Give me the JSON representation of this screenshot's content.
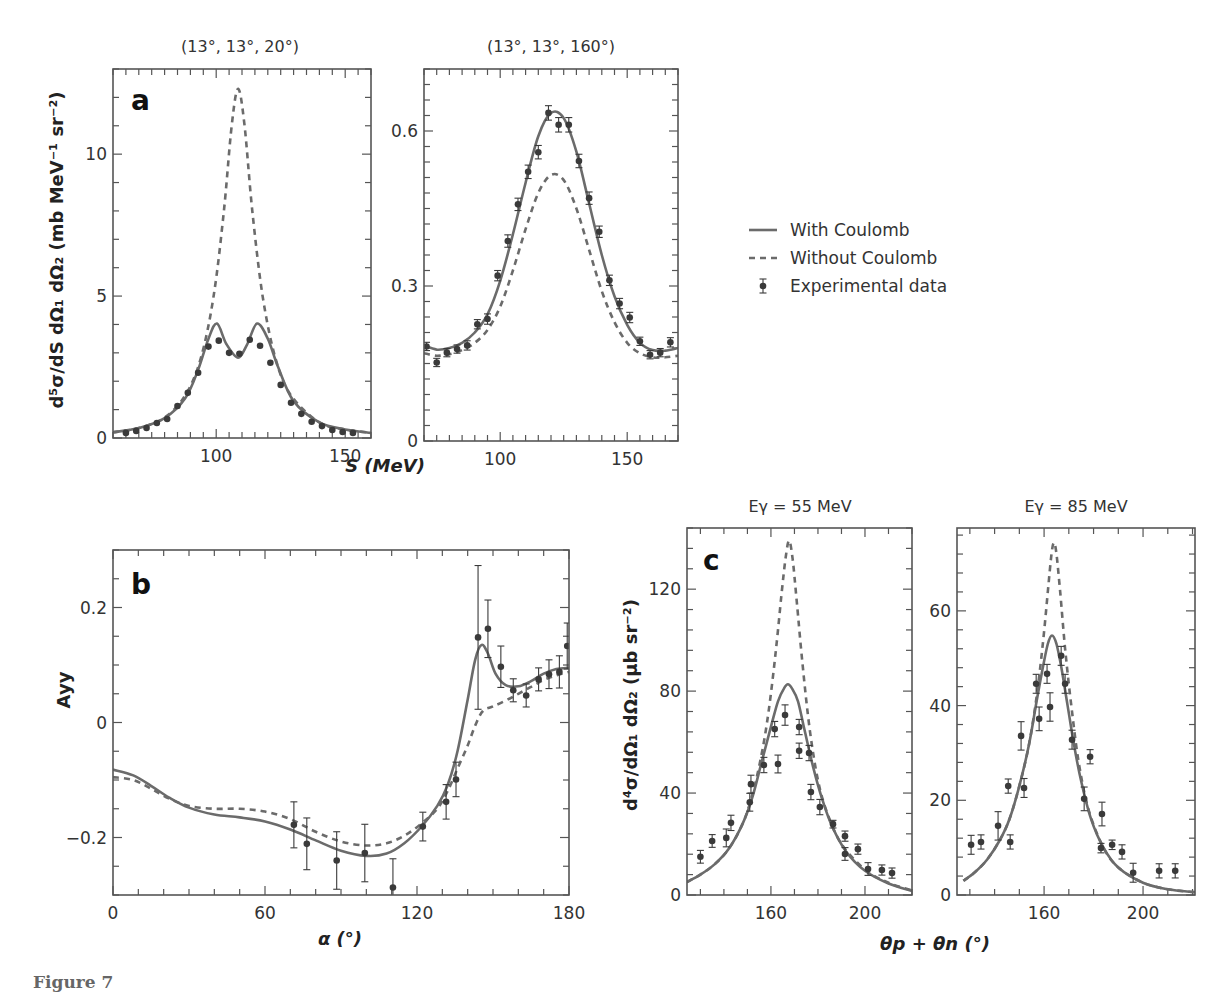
{
  "figure": {
    "caption": "Figure 7",
    "colors": {
      "solid": "#6b6b6b",
      "dashed": "#6b6b6b",
      "points": "#3a3a3a",
      "axes": "#555555"
    }
  },
  "legend": {
    "items": [
      {
        "label": "With Coulomb",
        "style": "solid"
      },
      {
        "label": "Without Coulomb",
        "style": "dashed"
      },
      {
        "label": "Experimental data",
        "style": "point"
      }
    ]
  },
  "chart_data": [
    {
      "id": "a-left",
      "panel": "a",
      "type": "line",
      "title": "(13°, 13°, 20°)",
      "xlabel": "S (MeV)",
      "ylabel": "d5σ/dS dΩ1 dΩ2 (mb MeV−1 sr−2)",
      "xlim": [
        60,
        160
      ],
      "ylim": [
        0,
        13
      ],
      "xticks": [
        100,
        150
      ],
      "yticks": [
        0,
        5,
        10
      ],
      "series": [
        {
          "name": "With Coulomb",
          "style": "solid",
          "x": [
            60,
            70,
            80,
            88,
            93,
            97,
            100.3,
            104,
            108.5,
            112,
            115.8,
            120,
            124,
            130,
            140,
            150,
            160
          ],
          "y": [
            0.2,
            0.35,
            0.7,
            1.4,
            2.4,
            3.5,
            4.03,
            3.3,
            2.83,
            3.3,
            4.03,
            3.5,
            2.5,
            1.3,
            0.55,
            0.3,
            0.18
          ]
        },
        {
          "name": "Without Coulomb",
          "style": "dashed",
          "x": [
            60,
            70,
            80,
            88,
            94,
            99,
            103,
            106,
            108.5,
            111,
            114,
            118,
            123,
            129,
            140,
            150,
            160
          ],
          "y": [
            0.2,
            0.35,
            0.72,
            1.5,
            2.8,
            5.0,
            8.0,
            11.0,
            12.3,
            11.0,
            8.0,
            5.0,
            2.8,
            1.5,
            0.55,
            0.3,
            0.18
          ]
        },
        {
          "name": "Experimental data",
          "style": "point",
          "x": [
            65,
            69,
            73,
            77,
            81,
            85,
            89,
            93,
            97,
            101,
            105,
            109,
            113,
            117,
            121,
            125,
            129,
            133,
            137,
            141,
            145,
            149,
            153
          ],
          "y": [
            0.18,
            0.25,
            0.35,
            0.53,
            0.67,
            1.13,
            1.59,
            2.3,
            3.22,
            3.43,
            3.0,
            2.97,
            3.46,
            3.25,
            2.65,
            1.87,
            1.24,
            0.85,
            0.57,
            0.42,
            0.28,
            0.21,
            0.18
          ],
          "err": []
        }
      ]
    },
    {
      "id": "a-right",
      "panel": "a",
      "type": "line",
      "title": "(13°, 13°, 160°)",
      "xlabel": "S (MeV)",
      "xlim": [
        70,
        170
      ],
      "ylim": [
        0,
        0.72
      ],
      "xticks": [
        100,
        150
      ],
      "yticks": [
        0,
        0.3,
        0.6
      ],
      "series": [
        {
          "name": "With Coulomb",
          "style": "solid",
          "x": [
            70,
            75,
            80,
            85,
            90,
            95,
            100,
            105,
            110,
            115,
            120,
            125,
            130,
            135,
            140,
            145,
            150,
            155,
            160,
            165,
            170
          ],
          "y": [
            0.185,
            0.177,
            0.18,
            0.19,
            0.21,
            0.245,
            0.31,
            0.4,
            0.5,
            0.59,
            0.635,
            0.625,
            0.56,
            0.46,
            0.36,
            0.28,
            0.225,
            0.19,
            0.176,
            0.175,
            0.18
          ]
        },
        {
          "name": "Without Coulomb",
          "style": "dashed",
          "x": [
            70,
            75,
            80,
            85,
            90,
            95,
            100,
            105,
            110,
            115,
            120,
            125,
            130,
            135,
            140,
            145,
            150,
            155,
            160,
            165,
            170
          ],
          "y": [
            0.17,
            0.165,
            0.168,
            0.176,
            0.19,
            0.215,
            0.26,
            0.33,
            0.41,
            0.48,
            0.515,
            0.505,
            0.45,
            0.37,
            0.29,
            0.23,
            0.19,
            0.17,
            0.162,
            0.162,
            0.165
          ]
        },
        {
          "name": "Experimental data",
          "style": "point",
          "x": [
            71,
            75,
            79,
            83,
            87,
            91,
            95,
            99,
            103,
            107,
            111,
            115,
            119,
            123,
            127,
            131,
            135,
            139,
            143,
            147,
            151,
            155,
            159,
            163,
            167
          ],
          "y": [
            0.183,
            0.152,
            0.171,
            0.178,
            0.185,
            0.226,
            0.236,
            0.32,
            0.387,
            0.458,
            0.521,
            0.559,
            0.635,
            0.612,
            0.612,
            0.542,
            0.47,
            0.405,
            0.311,
            0.266,
            0.239,
            0.193,
            0.167,
            0.171,
            0.191
          ],
          "err": [
            0.008,
            0.008,
            0.008,
            0.008,
            0.009,
            0.009,
            0.01,
            0.01,
            0.012,
            0.012,
            0.013,
            0.013,
            0.014,
            0.014,
            0.014,
            0.013,
            0.012,
            0.011,
            0.01,
            0.01,
            0.01,
            0.008,
            0.008,
            0.008,
            0.009
          ]
        }
      ]
    },
    {
      "id": "b",
      "panel": "b",
      "type": "line",
      "title": "",
      "xlabel": "α (°)",
      "ylabel": "Ayy",
      "xlim": [
        0,
        180
      ],
      "ylim": [
        -0.3,
        0.3
      ],
      "xticks": [
        0,
        60,
        120,
        180
      ],
      "yticks": [
        -0.2,
        0,
        0.2
      ],
      "series": [
        {
          "name": "With Coulomb",
          "style": "solid",
          "x": [
            0,
            8,
            15,
            22,
            30,
            40,
            50,
            60,
            70,
            80,
            90,
            100,
            108,
            115,
            122,
            128,
            132,
            136,
            140,
            143,
            145.5,
            148,
            151,
            155,
            160,
            165,
            170,
            175,
            180
          ],
          "y": [
            -0.082,
            -0.092,
            -0.11,
            -0.13,
            -0.148,
            -0.16,
            -0.165,
            -0.172,
            -0.186,
            -0.205,
            -0.223,
            -0.232,
            -0.228,
            -0.21,
            -0.18,
            -0.145,
            -0.11,
            -0.05,
            0.04,
            0.11,
            0.135,
            0.12,
            0.085,
            0.065,
            0.063,
            0.072,
            0.085,
            0.093,
            0.095
          ]
        },
        {
          "name": "Without Coulomb",
          "style": "dashed",
          "x": [
            0,
            8,
            15,
            22,
            30,
            40,
            50,
            60,
            70,
            80,
            90,
            100,
            108,
            115,
            122,
            128,
            132,
            136,
            140,
            143,
            146,
            150,
            155,
            160,
            165,
            170,
            175,
            180
          ],
          "y": [
            -0.095,
            -0.1,
            -0.115,
            -0.132,
            -0.145,
            -0.15,
            -0.15,
            -0.155,
            -0.168,
            -0.19,
            -0.207,
            -0.214,
            -0.21,
            -0.197,
            -0.175,
            -0.15,
            -0.12,
            -0.08,
            -0.04,
            -0.005,
            0.02,
            0.028,
            0.038,
            0.05,
            0.062,
            0.074,
            0.082,
            0.088
          ]
        },
        {
          "name": "Experimental data",
          "style": "point",
          "x": [
            71.4,
            76.5,
            88.3,
            99.4,
            110.5,
            122.3,
            131.5,
            135.4,
            144.1,
            148.0,
            153.1,
            158.0,
            163.1,
            168.0,
            172.1,
            176.2,
            179.3
          ],
          "y": [
            -0.178,
            -0.211,
            -0.24,
            -0.227,
            -0.287,
            -0.181,
            -0.138,
            -0.099,
            0.148,
            0.163,
            0.097,
            0.056,
            0.047,
            0.075,
            0.084,
            0.088,
            0.133
          ],
          "err": [
            0.04,
            0.045,
            0.05,
            0.05,
            0.05,
            0.025,
            0.03,
            0.03,
            0.125,
            0.05,
            0.036,
            0.02,
            0.02,
            0.02,
            0.025,
            0.028,
            0.04
          ]
        }
      ]
    },
    {
      "id": "c-left",
      "panel": "c",
      "type": "line",
      "title": "Eγ = 55 MeV",
      "xlabel": "θp + θn (°)",
      "ylabel": "d4σ/dΩ1 dΩ2 (μb sr−2)",
      "xlim": [
        124.3,
        220
      ],
      "ylim": [
        0,
        144
      ],
      "xticks": [
        160,
        200
      ],
      "yticks": [
        0,
        40,
        80,
        120
      ],
      "series": [
        {
          "name": "With Coulomb",
          "style": "solid",
          "x": [
            124.3,
            130,
            136,
            142,
            148,
            152,
            156,
            160,
            163,
            165.5,
            167.2,
            169,
            171.5,
            174,
            178,
            182,
            186,
            192,
            200,
            210,
            220
          ],
          "y": [
            5.1,
            8,
            12,
            18,
            28,
            38,
            52,
            66,
            76,
            81,
            82.7,
            81,
            76,
            66,
            50,
            37,
            27,
            17,
            9.5,
            4.5,
            1.6
          ]
        },
        {
          "name": "Without Coulomb",
          "style": "dashed",
          "x": [
            124.3,
            130,
            136,
            142,
            148,
            152,
            156,
            159,
            162,
            164.5,
            166.2,
            167.7,
            169.2,
            171,
            173.5,
            176.5,
            180,
            184,
            190,
            200,
            210,
            220
          ],
          "y": [
            5.1,
            8,
            12,
            18,
            28,
            39,
            55,
            72,
            95,
            118,
            132,
            139,
            132,
            115,
            90,
            65,
            45,
            32,
            20,
            10,
            4.8,
            1.8
          ]
        },
        {
          "name": "Experimental data",
          "style": "point",
          "x": [
            130,
            135,
            141,
            143,
            151,
            151.5,
            157,
            161.6,
            163,
            166,
            172,
            172,
            176.2,
            177,
            180.8,
            186.4,
            191.5,
            191.5,
            197,
            201.3,
            207.2,
            211.5
          ],
          "y": [
            15.0,
            21.2,
            22.4,
            28.3,
            36.4,
            43.5,
            51.0,
            65.1,
            51.4,
            70.6,
            65.9,
            56.6,
            55.7,
            40.4,
            34.5,
            27.8,
            23.1,
            16.1,
            18.0,
            10.2,
            9.8,
            8.6
          ],
          "err": [
            2.5,
            2.5,
            3.5,
            3,
            3.5,
            3.5,
            3,
            3,
            3.5,
            4,
            3,
            3,
            3,
            3,
            3,
            1.5,
            2,
            2.5,
            2,
            2.5,
            2,
            2
          ]
        }
      ]
    },
    {
      "id": "c-right",
      "panel": "c",
      "type": "line",
      "title": "Eγ = 85 MeV",
      "xlabel": "θp + θn (°)",
      "xlim": [
        124.8,
        221
      ],
      "ylim": [
        0,
        77.5
      ],
      "xticks": [
        160,
        200
      ],
      "yticks": [
        0,
        20,
        40,
        60
      ],
      "series": [
        {
          "name": "With Coulomb",
          "style": "solid",
          "x": [
            127.4,
            132,
            137,
            142,
            146,
            150,
            154,
            157,
            159.5,
            161.5,
            163.2,
            165,
            167,
            169.5,
            172,
            175,
            179,
            184,
            190,
            200,
            210,
            221
          ],
          "y": [
            3.0,
            4.8,
            7.5,
            11.5,
            16,
            23,
            32,
            41,
            48,
            53,
            54.8,
            53,
            48,
            40,
            32,
            24,
            16,
            10,
            5.8,
            2.6,
            1.2,
            0.6
          ]
        },
        {
          "name": "Without Coulomb",
          "style": "dashed",
          "x": [
            127.4,
            132,
            137,
            142,
            146,
            150,
            154,
            157,
            159.5,
            161.5,
            163,
            164,
            165,
            166.5,
            168.5,
            171,
            174,
            178,
            184,
            190,
            200,
            210,
            221
          ],
          "y": [
            3.0,
            4.8,
            7.5,
            11.5,
            16,
            23,
            32,
            42,
            53,
            64,
            72,
            74.4,
            72,
            64,
            52,
            40,
            28,
            18,
            10,
            5.8,
            2.6,
            1.2,
            0.6
          ]
        },
        {
          "name": "Experimental data",
          "style": "point",
          "x": [
            130.5,
            134.5,
            141.4,
            145.5,
            146.3,
            150.7,
            151.9,
            156.8,
            158.0,
            161.2,
            162.4,
            166.9,
            168.5,
            171.3,
            176.2,
            178.6,
            183.4,
            183.0,
            187.5,
            191.5,
            196.0,
            206.5,
            213.0
          ],
          "y": [
            10.6,
            11.2,
            14.6,
            23.0,
            11.2,
            33.6,
            22.6,
            44.6,
            37.2,
            46.7,
            39.7,
            50.5,
            44.6,
            32.8,
            20.3,
            29.2,
            17.1,
            9.9,
            10.6,
            9.1,
            4.7,
            5.1,
            5.1
          ],
          "err": [
            2,
            1.5,
            3,
            1.5,
            1.5,
            3,
            2,
            2,
            2.5,
            2,
            3,
            2,
            2,
            2,
            2.5,
            1.5,
            2.5,
            1,
            1,
            1.5,
            2,
            1.5,
            1.5
          ]
        }
      ]
    }
  ],
  "layout_labels": {
    "a_letter": "a",
    "b_letter": "b",
    "c_letter": "c",
    "a_ylabel_main": "d⁵σ/dS dΩ₁ dΩ₂ (mb MeV⁻¹ sr⁻²)",
    "a_xlabel": "S (MeV)",
    "b_ylabel": "Ayy",
    "b_xlabel": "α (°)",
    "c_ylabel": "d⁴σ/dΩ₁ dΩ₂ (μb sr⁻²)",
    "c_xlabel": "θp + θn (°)"
  }
}
